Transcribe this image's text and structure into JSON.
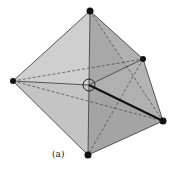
{
  "figure": {
    "label": "(a)",
    "colors": {
      "face_light": "#c9c9c9",
      "face_mid": "#b3b3b3",
      "face_dark": "#9c9c9c",
      "edge": "#333333",
      "vertex": "#111111"
    },
    "vertices": {
      "top": [
        90,
        11
      ],
      "upper_right": [
        143,
        59
      ],
      "left": [
        13,
        81
      ],
      "lower_right": [
        163,
        121
      ],
      "bottom": [
        88,
        155
      ]
    },
    "center": [
      89,
      85
    ]
  }
}
